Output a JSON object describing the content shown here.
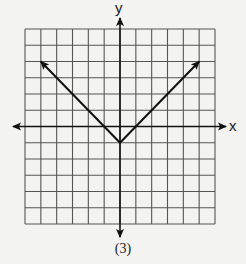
{
  "caption": "(3)",
  "axes": {
    "x_label": "x",
    "y_label": "y"
  },
  "chart_data": {
    "type": "line",
    "title": "",
    "caption": "(3)",
    "xlabel": "x",
    "ylabel": "y",
    "xlim": [
      -6,
      6
    ],
    "ylim": [
      -6,
      6
    ],
    "grid": true,
    "grid_step": 1,
    "axis_arrows": true,
    "series": [
      {
        "name": "y = |x| - 1",
        "x": [
          -5,
          0,
          5
        ],
        "y": [
          4,
          -1,
          4
        ],
        "arrows_at_ends": true
      }
    ]
  },
  "colors": {
    "grid": "#555555",
    "axes": "#111111",
    "curve": "#111111",
    "background": "#f3f3f1"
  }
}
